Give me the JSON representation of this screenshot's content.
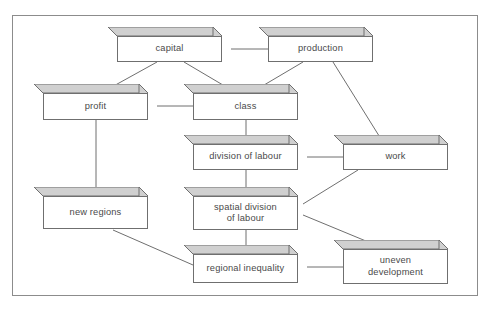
{
  "diagram": {
    "border_color": "#8c8c8c",
    "box_line_color": "#6f6f6f",
    "box_fill_color": "#ffffff",
    "box_shade_color": "#d0d0d0",
    "text_color": "#4a4a4a",
    "edge_color": "#6f6f6f",
    "nodes": [
      {
        "id": "capital",
        "label": "capital",
        "x": 117,
        "y": 36,
        "w": 105,
        "h": 26,
        "d": 9
      },
      {
        "id": "production",
        "label": "production",
        "x": 268,
        "y": 36,
        "w": 105,
        "h": 26,
        "d": 9
      },
      {
        "id": "profit",
        "label": "profit",
        "x": 43,
        "y": 93,
        "w": 105,
        "h": 27,
        "d": 9
      },
      {
        "id": "class",
        "label": "class",
        "x": 193,
        "y": 93,
        "w": 105,
        "h": 27,
        "d": 9
      },
      {
        "id": "division-of-labour",
        "label": "division of labour",
        "x": 193,
        "y": 144,
        "w": 105,
        "h": 26,
        "d": 9
      },
      {
        "id": "work",
        "label": "work",
        "x": 343,
        "y": 144,
        "w": 105,
        "h": 26,
        "d": 9
      },
      {
        "id": "new-regions",
        "label": "new regions",
        "x": 43,
        "y": 196,
        "w": 105,
        "h": 33,
        "d": 9
      },
      {
        "id": "spatial-division",
        "label": "spatial division\nof labour",
        "x": 193,
        "y": 196,
        "w": 105,
        "h": 34,
        "d": 9
      },
      {
        "id": "regional-inequality",
        "label": "regional inequality",
        "x": 193,
        "y": 254,
        "w": 105,
        "h": 29,
        "d": 9
      },
      {
        "id": "uneven-development",
        "label": "uneven\ndevelopment",
        "x": 343,
        "y": 249,
        "w": 105,
        "h": 35,
        "d": 9
      }
    ],
    "edges": [
      {
        "id": "capital-production",
        "from": "capital",
        "to": "production",
        "x1": 231,
        "y1": 49,
        "x2": 268,
        "y2": 49
      },
      {
        "id": "capital-profit",
        "from": "capital",
        "to": "profit",
        "x1": 157,
        "y1": 62,
        "x2": 110,
        "y2": 88
      },
      {
        "id": "capital-class",
        "from": "capital",
        "to": "class",
        "x1": 184,
        "y1": 62,
        "x2": 228,
        "y2": 88
      },
      {
        "id": "production-class",
        "from": "production",
        "to": "class",
        "x1": 303,
        "y1": 62,
        "x2": 259,
        "y2": 88
      },
      {
        "id": "production-work",
        "from": "production",
        "to": "work",
        "x1": 333,
        "y1": 62,
        "x2": 381,
        "y2": 139
      },
      {
        "id": "profit-class",
        "from": "profit",
        "to": "class",
        "x1": 157,
        "y1": 106,
        "x2": 193,
        "y2": 106
      },
      {
        "id": "profit-new-regions",
        "from": "profit",
        "to": "new-regions",
        "x1": 96,
        "y1": 120,
        "x2": 96,
        "y2": 192
      },
      {
        "id": "class-division-of-labour",
        "from": "class",
        "to": "division-of-labour",
        "x1": 246,
        "y1": 120,
        "x2": 246,
        "y2": 140
      },
      {
        "id": "division-of-labour-work",
        "from": "division-of-labour",
        "to": "work",
        "x1": 307,
        "y1": 157,
        "x2": 343,
        "y2": 157
      },
      {
        "id": "division-of-labour-spatial",
        "from": "division-of-labour",
        "to": "spatial-division",
        "x1": 246,
        "y1": 170,
        "x2": 246,
        "y2": 192
      },
      {
        "id": "work-spatial-division",
        "from": "work",
        "to": "spatial-division",
        "x1": 358,
        "y1": 170,
        "x2": 303,
        "y2": 204
      },
      {
        "id": "spatial-division-uneven-development",
        "from": "spatial-division",
        "to": "uneven-development",
        "x1": 303,
        "y1": 215,
        "x2": 378,
        "y2": 246
      },
      {
        "id": "spatial-division-regional",
        "from": "spatial-division",
        "to": "regional-inequality",
        "x1": 246,
        "y1": 230,
        "x2": 246,
        "y2": 250
      },
      {
        "id": "new-regions-regional-inequality",
        "from": "new-regions",
        "to": "regional-inequality",
        "x1": 113,
        "y1": 230,
        "x2": 193,
        "y2": 265
      },
      {
        "id": "regional-inequality-uneven",
        "from": "regional-inequality",
        "to": "uneven-development",
        "x1": 307,
        "y1": 267,
        "x2": 343,
        "y2": 267
      }
    ]
  }
}
